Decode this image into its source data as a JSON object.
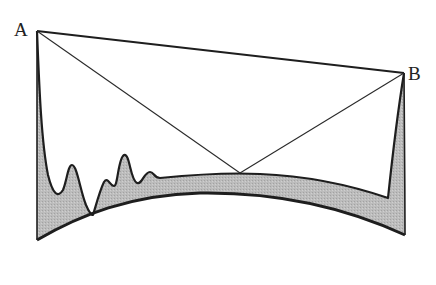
{
  "diagram": {
    "labels": {
      "a": "A",
      "b": "B"
    },
    "colors": {
      "stroke": "#1e1e1e",
      "fill": "#b8b8b8",
      "background": "#ffffff"
    },
    "points": {
      "A": [
        37,
        31
      ],
      "B": [
        404,
        73
      ],
      "V": [
        240,
        173
      ]
    }
  }
}
